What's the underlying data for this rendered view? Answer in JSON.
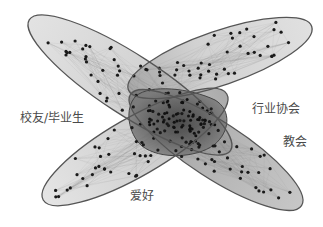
{
  "diagram": {
    "type": "overlapping-network-clusters",
    "colors": {
      "outline": "#555555",
      "fill_light": "#c8c8c8",
      "fill_mid": "#a9a9a9",
      "core": "#5a5a5a",
      "node": "#1a1a1a",
      "label": "#4a4a4a"
    },
    "clusters": [
      {
        "id": "alumni",
        "label": "校友/毕业生",
        "cx": 130,
        "cy": 85,
        "rx": 120,
        "ry": 30,
        "rot": 33
      },
      {
        "id": "industry",
        "label": "行业协会",
        "cx": 220,
        "cy": 58,
        "rx": 97,
        "ry": 27,
        "rot": -19
      },
      {
        "id": "church",
        "label": "教会",
        "cx": 216,
        "cy": 150,
        "rx": 102,
        "ry": 28,
        "rot": 33
      },
      {
        "id": "hobby",
        "label": "爱好",
        "cx": 135,
        "cy": 147,
        "rx": 106,
        "ry": 29,
        "rot": -30
      }
    ],
    "core": {
      "label": "",
      "cx": 178,
      "cy": 122
    },
    "labels": [
      {
        "id": "alumni",
        "text": "校友/毕业生",
        "x": 20,
        "y": 112
      },
      {
        "id": "industry",
        "text": "行业协会",
        "x": 252,
        "y": 103
      },
      {
        "id": "church",
        "text": "教会",
        "x": 283,
        "y": 136
      },
      {
        "id": "hobby",
        "text": "爱好",
        "x": 130,
        "y": 190
      }
    ]
  }
}
